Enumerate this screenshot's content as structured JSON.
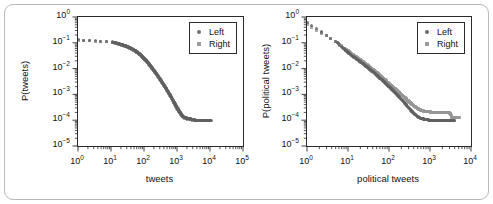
{
  "figure": {
    "border_color": "#b9b9b9",
    "background": "#ffffff"
  },
  "chart_data": [
    {
      "type": "scatter",
      "panel": "left",
      "title": "",
      "xlabel": "tweets",
      "ylabel": "P(tweets)",
      "xscale": "log",
      "yscale": "log",
      "xlim": [
        1,
        100000
      ],
      "ylim": [
        1e-05,
        1
      ],
      "xticks": [
        "10^0",
        "10^1",
        "10^2",
        "10^3",
        "10^4",
        "10^5"
      ],
      "xtick_labels": [
        "10",
        "10",
        "10",
        "10",
        "10",
        "10"
      ],
      "xtick_exponents": [
        "0",
        "1",
        "2",
        "3",
        "4",
        "5"
      ],
      "yticks": [
        "10^0",
        "10^-1",
        "10^-2",
        "10^-3",
        "10^-4",
        "10^-5"
      ],
      "ytick_labels": [
        "10",
        "10",
        "10",
        "10",
        "10",
        "10"
      ],
      "ytick_exponents": [
        "0",
        "-1",
        "-2",
        "-3",
        "-4",
        "-5"
      ],
      "grid": false,
      "legend_position": "upper-right",
      "series": [
        {
          "name": "Left",
          "marker": "circle",
          "color": "#606060",
          "points": [
            [
              1.0,
              0.13
            ],
            [
              11.0,
              0.108
            ],
            [
              14.0,
              0.099
            ],
            [
              17.0,
              0.092
            ],
            [
              21.0,
              0.085
            ],
            [
              25.0,
              0.079
            ],
            [
              30.0,
              0.073
            ],
            [
              36.0,
              0.066
            ],
            [
              43.0,
              0.059
            ],
            [
              51.0,
              0.052
            ],
            [
              60.0,
              0.045
            ],
            [
              70.0,
              0.039
            ],
            [
              82.0,
              0.033
            ],
            [
              95.0,
              0.027
            ],
            [
              110.0,
              0.022
            ],
            [
              128.0,
              0.018
            ],
            [
              148.0,
              0.0145
            ],
            [
              170.0,
              0.0115
            ],
            [
              195.0,
              0.0091
            ],
            [
              225.0,
              0.0072
            ],
            [
              258.0,
              0.0056
            ],
            [
              296.0,
              0.0043
            ],
            [
              340.0,
              0.0033
            ],
            [
              390.0,
              0.0025
            ],
            [
              448.0,
              0.0019
            ],
            [
              514.0,
              0.0014
            ],
            [
              590.0,
              0.00105
            ],
            [
              677.0,
              0.00077
            ],
            [
              777.0,
              0.00056
            ],
            [
              892.0,
              0.00041
            ],
            [
              1024.0,
              0.0003
            ],
            [
              1175.0,
              0.00022
            ],
            [
              1349.0,
              0.00017
            ],
            [
              1549.0,
              0.00014
            ],
            [
              1778.0,
              0.000125
            ],
            [
              2042.0,
              0.00012
            ],
            [
              2344.0,
              0.000115
            ],
            [
              2692.0,
              0.00011
            ],
            [
              3090.0,
              0.00011
            ],
            [
              3548.0,
              0.0001
            ],
            [
              4074.0,
              0.0001
            ],
            [
              4677.0,
              0.0001
            ],
            [
              5370.0,
              0.0001
            ],
            [
              6166.0,
              0.0001
            ],
            [
              7079.0,
              0.0001
            ],
            [
              8128.0,
              0.0001
            ],
            [
              9332.0,
              0.0001
            ],
            [
              10715.0,
              0.0001
            ]
          ]
        },
        {
          "name": "Right",
          "marker": "square",
          "color": "#969696",
          "points": [
            [
              1.0,
              0.125
            ],
            [
              11.0,
              0.105
            ],
            [
              14.0,
              0.097
            ],
            [
              17.0,
              0.09
            ],
            [
              21.0,
              0.083
            ],
            [
              25.0,
              0.077
            ],
            [
              30.0,
              0.071
            ],
            [
              36.0,
              0.064
            ],
            [
              43.0,
              0.057
            ],
            [
              51.0,
              0.05
            ],
            [
              60.0,
              0.044
            ],
            [
              70.0,
              0.038
            ],
            [
              82.0,
              0.032
            ],
            [
              95.0,
              0.026
            ],
            [
              110.0,
              0.021
            ],
            [
              128.0,
              0.0172
            ],
            [
              148.0,
              0.0138
            ],
            [
              170.0,
              0.011
            ],
            [
              195.0,
              0.0087
            ],
            [
              225.0,
              0.0068
            ],
            [
              258.0,
              0.0053
            ],
            [
              296.0,
              0.0041
            ],
            [
              340.0,
              0.0031
            ],
            [
              390.0,
              0.0024
            ],
            [
              448.0,
              0.0018
            ],
            [
              514.0,
              0.00132
            ],
            [
              590.0,
              0.00098
            ],
            [
              677.0,
              0.00072
            ],
            [
              777.0,
              0.00052
            ],
            [
              892.0,
              0.00038
            ],
            [
              1024.0,
              0.00028
            ],
            [
              1175.0,
              0.00021
            ],
            [
              1349.0,
              0.00016
            ],
            [
              1549.0,
              0.000132
            ],
            [
              1778.0,
              0.000118
            ],
            [
              2042.0,
              0.000112
            ],
            [
              2344.0,
              0.000108
            ],
            [
              2692.0,
              0.000104
            ],
            [
              3090.0,
              0.0001
            ],
            [
              3548.0,
              0.0001
            ],
            [
              4074.0,
              0.0001
            ],
            [
              4677.0,
              0.0001
            ],
            [
              5370.0,
              0.0001
            ]
          ]
        }
      ]
    },
    {
      "type": "scatter",
      "panel": "right",
      "title": "",
      "xlabel": "political tweets",
      "ylabel": "P(political tweets)",
      "xscale": "log",
      "yscale": "log",
      "xlim": [
        1,
        10000
      ],
      "ylim": [
        1e-05,
        1
      ],
      "xticks": [
        "10^0",
        "10^1",
        "10^2",
        "10^3",
        "10^4"
      ],
      "xtick_labels": [
        "10",
        "10",
        "10",
        "10",
        "10"
      ],
      "xtick_exponents": [
        "0",
        "1",
        "2",
        "3",
        "4"
      ],
      "yticks": [
        "10^0",
        "10^-1",
        "10^-2",
        "10^-3",
        "10^-4",
        "10^-5"
      ],
      "ytick_labels": [
        "10",
        "10",
        "10",
        "10",
        "10",
        "10"
      ],
      "ytick_exponents": [
        "0",
        "-1",
        "-2",
        "-3",
        "-4",
        "-5"
      ],
      "grid": false,
      "legend_position": "upper-right",
      "series": [
        {
          "name": "Left",
          "marker": "circle",
          "color": "#606060",
          "points": [
            [
              1.0,
              0.6
            ],
            [
              5.0,
              0.115
            ],
            [
              8.0,
              0.058
            ],
            [
              10.0,
              0.042
            ],
            [
              12.0,
              0.033
            ],
            [
              15.0,
              0.026
            ],
            [
              18.0,
              0.021
            ],
            [
              21.0,
              0.0175
            ],
            [
              25.0,
              0.0142
            ],
            [
              30.0,
              0.0112
            ],
            [
              35.0,
              0.009
            ],
            [
              42.0,
              0.0072
            ],
            [
              50.0,
              0.0056
            ],
            [
              58.0,
              0.0045
            ],
            [
              68.0,
              0.0036
            ],
            [
              80.0,
              0.0028
            ],
            [
              94.0,
              0.0022
            ],
            [
              110.0,
              0.00175
            ],
            [
              128.0,
              0.00138
            ],
            [
              150.0,
              0.00105
            ],
            [
              175.0,
              0.00082
            ],
            [
              205.0,
              0.00062
            ],
            [
              240.0,
              0.00048
            ],
            [
              280.0,
              0.00035
            ],
            [
              328.0,
              0.00026
            ],
            [
              383.0,
              0.0002
            ],
            [
              448.0,
              0.00016
            ],
            [
              524.0,
              0.00013
            ],
            [
              613.0,
              0.000115
            ],
            [
              717.0,
              0.00011
            ],
            [
              838.0,
              0.000105
            ],
            [
              980.0,
              0.0001
            ],
            [
              1147.0,
              0.0001
            ],
            [
              1342.0,
              0.0001
            ],
            [
              1570.0,
              0.0001
            ],
            [
              1836.0,
              0.0001
            ],
            [
              2148.0,
              0.0001
            ],
            [
              2512.0,
              0.0001
            ],
            [
              2938.0,
              0.0001
            ],
            [
              3437.0,
              0.0001
            ],
            [
              4020.0,
              0.0001
            ]
          ]
        },
        {
          "name": "Right",
          "marker": "square",
          "color": "#969696",
          "points": [
            [
              1.0,
              0.52
            ],
            [
              5.0,
              0.11
            ],
            [
              8.0,
              0.062
            ],
            [
              10.0,
              0.048
            ],
            [
              12.0,
              0.038
            ],
            [
              15.0,
              0.03
            ],
            [
              18.0,
              0.025
            ],
            [
              21.0,
              0.0205
            ],
            [
              25.0,
              0.0168
            ],
            [
              30.0,
              0.0135
            ],
            [
              35.0,
              0.011
            ],
            [
              42.0,
              0.0088
            ],
            [
              50.0,
              0.007
            ],
            [
              58.0,
              0.0057
            ],
            [
              68.0,
              0.0046
            ],
            [
              80.0,
              0.0036
            ],
            [
              94.0,
              0.0029
            ],
            [
              110.0,
              0.0023
            ],
            [
              128.0,
              0.0019
            ],
            [
              150.0,
              0.0015
            ],
            [
              175.0,
              0.00118
            ],
            [
              205.0,
              0.00094
            ],
            [
              240.0,
              0.00075
            ],
            [
              280.0,
              0.0006
            ],
            [
              328.0,
              0.00048
            ],
            [
              383.0,
              0.00039
            ],
            [
              448.0,
              0.00032
            ],
            [
              524.0,
              0.00027
            ],
            [
              613.0,
              0.00024
            ],
            [
              717.0,
              0.00022
            ],
            [
              838.0,
              0.00021
            ],
            [
              980.0,
              0.00021
            ],
            [
              1147.0,
              0.0002
            ],
            [
              1342.0,
              0.0002
            ],
            [
              1570.0,
              0.0002
            ],
            [
              1836.0,
              0.0002
            ],
            [
              2148.0,
              0.0002
            ],
            [
              2512.0,
              0.0002
            ],
            [
              2938.0,
              0.0002
            ],
            [
              3437.0,
              0.00013
            ],
            [
              4020.0,
              0.00013
            ],
            [
              5200.0,
              0.00013
            ]
          ]
        }
      ]
    }
  ]
}
